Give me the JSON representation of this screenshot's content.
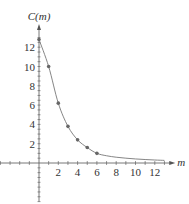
{
  "chart_data": {
    "type": "scatter",
    "title": "",
    "xlabel": "m",
    "ylabel": "C(m)",
    "x_ticks": [
      2,
      4,
      6,
      8,
      10,
      12
    ],
    "y_ticks": [
      2,
      4,
      6,
      8,
      10,
      12
    ],
    "xlim": [
      -8.5,
      13.5
    ],
    "ylim": [
      -4,
      14
    ],
    "grid": false,
    "legend": null,
    "series": [
      {
        "name": "data points",
        "type": "scatter",
        "x": [
          0,
          1,
          2,
          3,
          4,
          5,
          6
        ],
        "y": [
          12.8,
          10,
          6.2,
          3.8,
          2.4,
          1.6,
          1.0
        ]
      },
      {
        "name": "fitted curve",
        "type": "line",
        "description": "smooth decreasing curve through points, approaching ~0.3 near m=13"
      }
    ]
  },
  "colors": {
    "axis": "#555555",
    "curve": "#777777",
    "points": "#666666"
  }
}
